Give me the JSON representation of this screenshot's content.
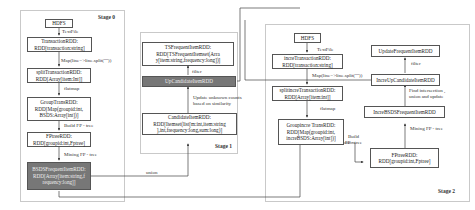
{
  "stages": {
    "stage0": "Stage 0",
    "stage1": "Stage 1",
    "stage2": "Stage 2"
  },
  "stage0": {
    "hdfs": "HDFS",
    "textfile": "TextFile",
    "transaction_rdd": "TransactionRDD:\nRDD[transaction:string]",
    "map": "Map(line=>line.split(\"\"))",
    "split_transaction_rdd": "splitTransactionRDD:\nRDD[Array[item:Int]]",
    "flatmap": "flatmap",
    "group_trans_rdd": "GroupTransRDD:\nRDD[Map(groupid:int,\nBSDS:Array[int])]",
    "build_fp_tree": "Build FP - tree",
    "fptree_rdd": "FPtreeRDD:\nRDD[groupid:int,Fptree]",
    "mining_fp_tree": "Mining FP - tree",
    "bsds_frequent_item_rdd": "BSDSFrequentItemRDD:\nRDD[Array[item:string,f\nrequency:long]]"
  },
  "stage1": {
    "ts_frequent_item_rdd": "TSFrequentItemRDD:\nRDD[TSFrequentItemset(Arra\ny[item:string,frequency:long])]",
    "filter": "filter",
    "up_candidate_item_rdd": "UpCandidateItemRDD",
    "update_unknown": "Update unknown counts\nbased on similarity",
    "candidate_item_rdd": "CandidateItemRDD:\nRDD[Itemset(list[m:int,item:string\n],int,frequency:long,sum:long)]",
    "union": "union"
  },
  "stage2": {
    "hdfs": "HDFS",
    "textfile": "TextFile",
    "incre_transaction_rdd": "increTransactionRDD:\nRDD[transaction:string]",
    "map": "Map(line=>line.split(\"\"))",
    "split_incre_transaction_rdd": "splitincreTransactionRDD:\nRDD[Array[item:int]]",
    "flatmap": "flatmap",
    "group_incre_trans_rdd": "Groupincre TransRDD:\nRDD[Map(groupid:int,\nincreBSDS:Array[int])]",
    "build_fp_tree": "Build\nFP - tree",
    "fptree_rdd": "FPtreeRDD:\nRDD[groupid:int,Fptree]",
    "mining_fp_tree": "Mining FP - tree",
    "incre_bsds_frequent_item_rdd": "IncreBSDSFrequentItemRDD",
    "find_intersection": "Find intersection ,\nunion and update",
    "incre_up_candidate_item_rdd": "IncreUpCandidateItemRDD",
    "filter": "filter",
    "update_frequent_item_rdd": "UpdateFrequentItemRDD"
  }
}
